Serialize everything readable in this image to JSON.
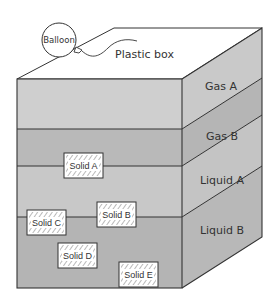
{
  "diagram": {
    "type": "layered container cross-section",
    "container_label": "Plastic box",
    "balloon_label": "Balloon",
    "layers": [
      {
        "name": "Gas A",
        "label": "Gas A",
        "color_front": "#cfcfcf",
        "color_side": "#c9c9c9"
      },
      {
        "name": "Gas B",
        "label": "Gas B",
        "color_front": "#b9b9b9",
        "color_side": "#b5b5b5"
      },
      {
        "name": "Liquid A",
        "label": "Liquid A",
        "color_front": "#c8c8c8",
        "color_side": "#c4c4c4"
      },
      {
        "name": "Liquid B",
        "label": "Liquid B",
        "color_front": "#b4b4b4",
        "color_side": "#b8b8b8"
      }
    ],
    "solids": [
      {
        "label": "Solid A",
        "position": "floating at Gas B / Liquid A boundary"
      },
      {
        "label": "Solid B",
        "position": "floating at Liquid A / Liquid B boundary"
      },
      {
        "label": "Solid C",
        "position": "floating at Liquid A / Liquid B boundary"
      },
      {
        "label": "Solid D",
        "position": "suspended in Liquid B"
      },
      {
        "label": "Solid E",
        "position": "at bottom of Liquid B"
      }
    ],
    "colors": {
      "outline": "#333333",
      "top_face": "#ffffff",
      "solid_fill": "#ffffff",
      "hatch": "#555555"
    }
  }
}
